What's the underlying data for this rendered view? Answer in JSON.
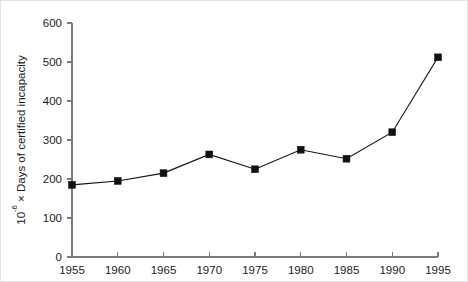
{
  "chart_data": {
    "type": "line",
    "title": "",
    "subtitle": "",
    "xlabel": "",
    "ylabel": "10-6 × Days of certified incapacity",
    "ylabel_parts": {
      "base": "10",
      "exponent": "-6",
      "rest": " × Days of certified incapacity"
    },
    "x": [
      1955,
      1960,
      1965,
      1970,
      1975,
      1980,
      1985,
      1990,
      1995
    ],
    "values": [
      185,
      195,
      215,
      263,
      225,
      275,
      252,
      320,
      512
    ],
    "categories": [
      "1955",
      "1960",
      "1965",
      "1970",
      "1975",
      "1980",
      "1985",
      "1990",
      "1995"
    ],
    "xtick_labels": [
      "1955",
      "1960",
      "1965",
      "1970",
      "1975",
      "1980",
      "1985",
      "1990",
      "1995"
    ],
    "ytick_labels": [
      "0",
      "100",
      "200",
      "300",
      "400",
      "500",
      "600"
    ],
    "yticks": [
      0,
      100,
      200,
      300,
      400,
      500,
      600
    ],
    "xlim": [
      1955,
      1995
    ],
    "ylim": [
      0,
      600
    ],
    "grid": false,
    "legend": null,
    "legend_position": "none",
    "marker": "square",
    "line_color": "#111111",
    "marker_color": "#111111",
    "axis_color": "#7a7a7a",
    "background": "#ffffff",
    "series": [
      {
        "name": "Days of certified incapacity",
        "values": [
          185,
          195,
          215,
          263,
          225,
          275,
          252,
          320,
          512
        ]
      }
    ],
    "points": [
      {
        "x": "1955",
        "y": 185
      },
      {
        "x": "1960",
        "y": 195
      },
      {
        "x": "1965",
        "y": 215
      },
      {
        "x": "1970",
        "y": 263
      },
      {
        "x": "1975",
        "y": 225
      },
      {
        "x": "1980",
        "y": 275
      },
      {
        "x": "1985",
        "y": 252
      },
      {
        "x": "1990",
        "y": 320
      },
      {
        "x": "1995",
        "y": 512
      }
    ]
  }
}
